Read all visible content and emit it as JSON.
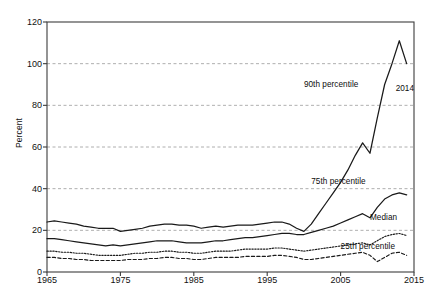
{
  "chart_data": {
    "type": "line",
    "title": "",
    "xlabel": "",
    "ylabel": "Percent",
    "xlim": [
      1965,
      2015
    ],
    "ylim": [
      0,
      120
    ],
    "xticks": [
      1965,
      1975,
      1985,
      1995,
      2005,
      2015
    ],
    "yticks": [
      0,
      20,
      40,
      60,
      80,
      100,
      120
    ],
    "grid": "horizontal dashed gray gridlines at 20,40,60,80,100",
    "legend_position": "inline annotations on plot",
    "x": [
      1965,
      1966,
      1967,
      1968,
      1969,
      1970,
      1971,
      1972,
      1973,
      1974,
      1975,
      1976,
      1977,
      1978,
      1979,
      1980,
      1981,
      1982,
      1983,
      1984,
      1985,
      1986,
      1987,
      1988,
      1989,
      1990,
      1991,
      1992,
      1993,
      1994,
      1995,
      1996,
      1997,
      1998,
      1999,
      2000,
      2001,
      2002,
      2003,
      2004,
      2005,
      2006,
      2007,
      2008,
      2009,
      2010,
      2011,
      2012,
      2013,
      2014
    ],
    "series": [
      {
        "name": "90th percentile",
        "style": "solid",
        "values": [
          24,
          24.5,
          24,
          23.5,
          23,
          22,
          21.5,
          21,
          21,
          21,
          19.5,
          20,
          20.5,
          21,
          22,
          22.5,
          23,
          23,
          22.5,
          22.5,
          22,
          21,
          21.5,
          22,
          21.5,
          22,
          22.5,
          22.5,
          22.5,
          23,
          23.5,
          24,
          24,
          23,
          21,
          19.5,
          23,
          28,
          33,
          38,
          43,
          49,
          56,
          62,
          57,
          74,
          90,
          100,
          111,
          100
        ]
      },
      {
        "name": "75th percentile",
        "style": "solid",
        "values": [
          16,
          16,
          15.5,
          15,
          14.5,
          14,
          13.5,
          13,
          12.5,
          13,
          12.5,
          13,
          13.5,
          14,
          14.5,
          15,
          15,
          15,
          14.5,
          14,
          14,
          14,
          14.5,
          15,
          15,
          15.5,
          16,
          16.5,
          16.5,
          17,
          17.5,
          18,
          18.5,
          18.5,
          18,
          18,
          19,
          20,
          21,
          22,
          23.5,
          25,
          26.5,
          28,
          26,
          31,
          35,
          37,
          38,
          37
        ]
      },
      {
        "name": "Median",
        "style": "dotted",
        "values": [
          10,
          10,
          9.5,
          9.5,
          9,
          9,
          8.5,
          8,
          8,
          8,
          8,
          8.5,
          9,
          9,
          9.5,
          9.5,
          10,
          10,
          9.5,
          9.5,
          9,
          9,
          9.5,
          10,
          10,
          10,
          10.5,
          11,
          11,
          11,
          11,
          11.5,
          11.5,
          11,
          10.5,
          10,
          10.5,
          11,
          11.5,
          12,
          12.5,
          13,
          13.5,
          14,
          13,
          15,
          17,
          18,
          18.5,
          17.5
        ]
      },
      {
        "name": "25th percentile",
        "style": "dashed",
        "values": [
          7,
          7,
          6.5,
          6.5,
          6,
          6,
          5.5,
          5.5,
          5.5,
          5.5,
          5.5,
          6,
          6,
          6,
          6.5,
          6.5,
          7,
          7,
          6.5,
          6.5,
          6,
          6,
          6.5,
          7,
          7,
          7,
          7,
          7.5,
          7.5,
          7.5,
          7.5,
          8,
          8,
          7.5,
          7,
          6,
          6,
          6.5,
          7,
          7.5,
          8,
          8.5,
          9,
          9.5,
          8,
          5,
          7,
          9,
          9.5,
          8
        ]
      }
    ],
    "annotations": [
      {
        "text": "90th percentile",
        "x": 2000,
        "y": 90
      },
      {
        "text": "2014",
        "x": 2012.5,
        "y": 88
      },
      {
        "text": "75th percentile",
        "x": 2001,
        "y": 43
      },
      {
        "text": "Median",
        "x": 2009,
        "y": 26
      },
      {
        "text": "25th percentile",
        "x": 2005,
        "y": 12
      }
    ],
    "colors": {
      "line": "#1a1a1a",
      "grid": "#9a9a9a",
      "frame": "#3c3c3c",
      "text": "#111111",
      "background": "#ffffff"
    }
  }
}
